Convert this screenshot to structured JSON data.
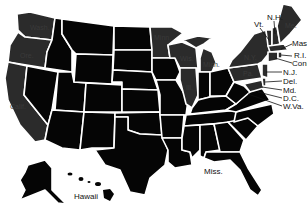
{
  "map": {
    "title": "United States map",
    "colors": {
      "default": "#050505",
      "shaded": "#2b2b2b",
      "border": "#ffffff",
      "background": "#ffffff"
    },
    "shaded_states": [
      "Wash.",
      "Ore.",
      "Calif.",
      "Minn.",
      "Wis.",
      "Mich.",
      "Ill.",
      "N.Y.",
      "Pa.",
      "Maine",
      "Vt.",
      "N.H.",
      "Mass.",
      "R.I.",
      "Conn.",
      "N.J.",
      "Del.",
      "Md.",
      "D.C."
    ],
    "labels": {
      "wash": "Wash.",
      "ore": "Ore.",
      "calif": "Calif.",
      "minn": "Minn.",
      "wis": "Wis.",
      "mich": "Mich.",
      "ill": "Ill.",
      "ny": "N.Y.",
      "pa": "Pa.",
      "me": "Me.",
      "vt": "Vt.",
      "nh": "N.H.",
      "mass": "Mass.",
      "ri": "R.I.",
      "conn": "Conn.",
      "nj": "N.J.",
      "del": "Del.",
      "md": "Md.",
      "dc": "D.C.",
      "wva": "W.Va.",
      "miss": "Miss.",
      "hawaii": "Hawaii"
    }
  }
}
